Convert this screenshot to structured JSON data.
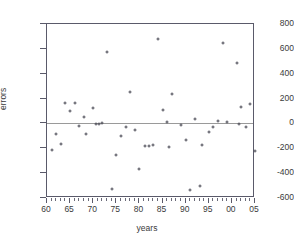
{
  "chart_data": {
    "type": "scatter",
    "title": "",
    "xlabel": "years",
    "ylabel": "errors",
    "xlim": [
      60,
      105
    ],
    "ylim": [
      -600,
      800
    ],
    "xticks": [
      60,
      65,
      70,
      75,
      80,
      85,
      90,
      95,
      100,
      105
    ],
    "xticklabels": [
      "60",
      "65",
      "70",
      "75",
      "80",
      "85",
      "90",
      "95",
      "00",
      "05"
    ],
    "yticks": [
      800,
      600,
      400,
      200,
      0,
      -200,
      -400,
      -600
    ],
    "yticklabels": [
      "800",
      "600",
      "400",
      "200",
      "0",
      "-200",
      "-400",
      "-600"
    ],
    "minor_x_tick_step": 1,
    "grid": false,
    "legend": null,
    "reference_line_y": 0,
    "marker": "open-circle",
    "marker_color": "#4a4a55",
    "frame_color": "#5a5a6a",
    "reference_line_color": "#9a9a9a",
    "points": [
      {
        "x": 61,
        "y": -215
      },
      {
        "x": 62,
        "y": -85
      },
      {
        "x": 63,
        "y": -163
      },
      {
        "x": 64,
        "y": 168
      },
      {
        "x": 65,
        "y": 103
      },
      {
        "x": 66,
        "y": 168
      },
      {
        "x": 67,
        "y": -22
      },
      {
        "x": 68,
        "y": 50
      },
      {
        "x": 68.5,
        "y": -88
      },
      {
        "x": 70,
        "y": 128
      },
      {
        "x": 70.7,
        "y": -5
      },
      {
        "x": 71.3,
        "y": -5
      },
      {
        "x": 72,
        "y": 2
      },
      {
        "x": 73,
        "y": 575
      },
      {
        "x": 74,
        "y": -525
      },
      {
        "x": 75,
        "y": -258
      },
      {
        "x": 76,
        "y": -105
      },
      {
        "x": 77,
        "y": -30
      },
      {
        "x": 78,
        "y": 255
      },
      {
        "x": 79,
        "y": -50
      },
      {
        "x": 80,
        "y": -370
      },
      {
        "x": 81.3,
        "y": -178
      },
      {
        "x": 82,
        "y": -180
      },
      {
        "x": 83,
        "y": -175
      },
      {
        "x": 84,
        "y": 680
      },
      {
        "x": 85,
        "y": 105
      },
      {
        "x": 86,
        "y": 8
      },
      {
        "x": 86.5,
        "y": -190
      },
      {
        "x": 87,
        "y": 238
      },
      {
        "x": 89,
        "y": -15
      },
      {
        "x": 90,
        "y": -133
      },
      {
        "x": 91,
        "y": -535
      },
      {
        "x": 92,
        "y": 35
      },
      {
        "x": 93,
        "y": -505
      },
      {
        "x": 93.5,
        "y": -175
      },
      {
        "x": 95,
        "y": -65
      },
      {
        "x": 96,
        "y": -28
      },
      {
        "x": 97,
        "y": 18
      },
      {
        "x": 98,
        "y": 645
      },
      {
        "x": 99,
        "y": 12
      },
      {
        "x": 101,
        "y": 485
      },
      {
        "x": 101.5,
        "y": -8
      },
      {
        "x": 102,
        "y": 130
      },
      {
        "x": 103,
        "y": -25
      },
      {
        "x": 104,
        "y": 158
      },
      {
        "x": 105,
        "y": -222
      }
    ]
  }
}
